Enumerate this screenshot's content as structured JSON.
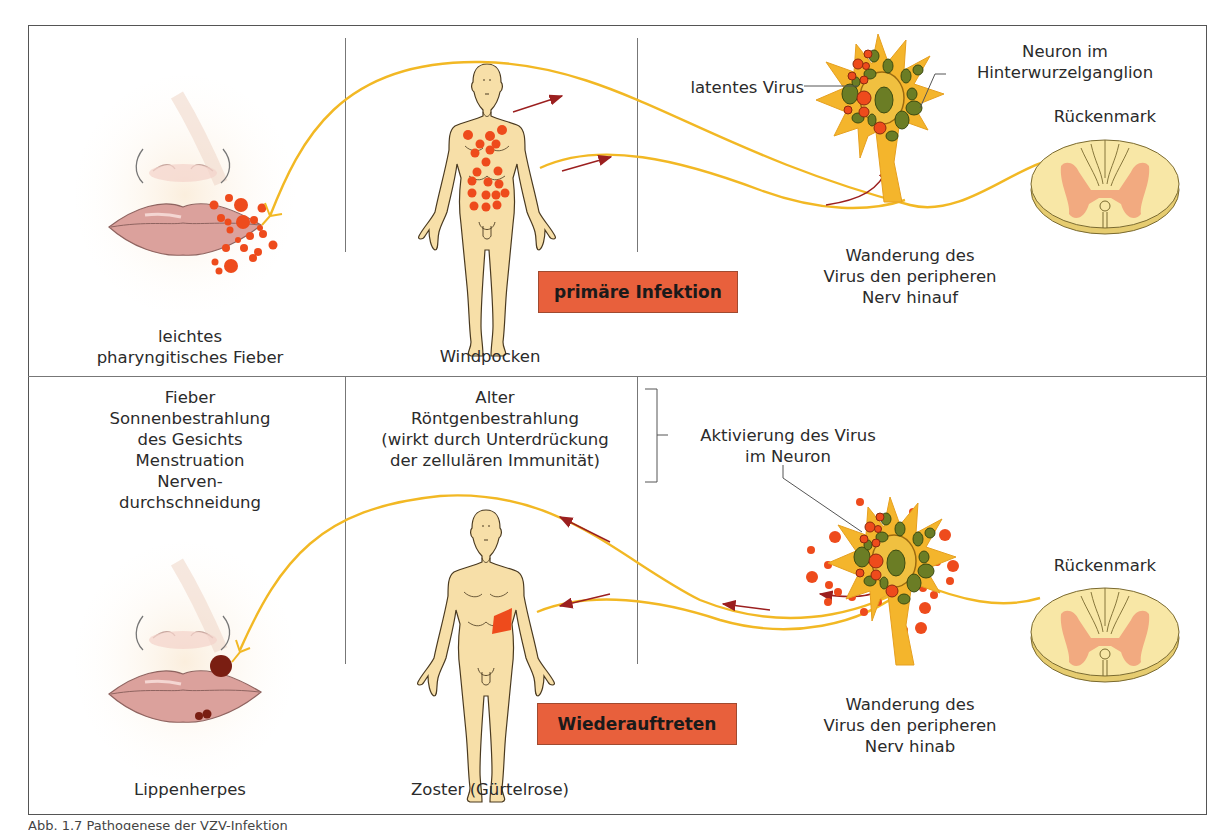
{
  "figure": {
    "caption": "Abb. 1.7 Pathogenese der VZV-Infektion",
    "colors": {
      "nerve": "#f2b824",
      "skin": "#f7dfa8",
      "lesion": "#ee4b1c",
      "scab": "#7a1e12",
      "stage_box": "#e8603c",
      "arrow": "#9b1f1f",
      "neuron_body": "#f4b52c",
      "neuron_inclusion": "#6b7d25",
      "spinal_white": "#f8e7a6",
      "spinal_grey": "#f2aa80"
    }
  },
  "top_row": {
    "stage_label": "primäre Infektion",
    "face_caption": "leichtes\npharyngitisches Fieber",
    "body_caption": "Windpocken",
    "neuron_label_virus": "latentes Virus",
    "neuron_label_title": "Neuron im\nHinterwurzelganglion",
    "spinal_label": "Rückenmark",
    "migration_label": "Wanderung des\nVirus den peripheren\nNerv hinauf"
  },
  "bottom_row": {
    "stage_label": "Wiederauftreten",
    "triggers_left": "Fieber\nSonnenbestrahlung\ndes Gesichts\nMenstruation\nNerven-\ndurchschneidung",
    "triggers_middle": "Alter\nRöntgenbestrahlung\n(wirkt durch Unterdrückung\nder zellulären Immunität)",
    "activation_label": "Aktivierung des Virus\nim Neuron",
    "spinal_label": "Rückenmark",
    "migration_label": "Wanderung des\nVirus den peripheren\nNerv hinab",
    "face_caption": "Lippenherpes",
    "body_caption": "Zoster (Gürtelrose)"
  }
}
